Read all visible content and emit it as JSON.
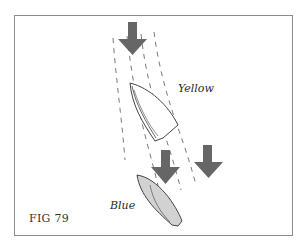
{
  "figure": {
    "label": "FIG 79"
  },
  "boats": [
    {
      "name": "Yellow",
      "fill": "#ffffff",
      "stroke": "#444444"
    },
    {
      "name": "Blue",
      "fill": "#d2d2d2",
      "stroke": "#444444"
    }
  ],
  "arrows": {
    "count": 3,
    "color": "#666666",
    "description": "current/wind direction arrows pointing down"
  },
  "stream": {
    "style": "dashed lines",
    "color": "#555555"
  }
}
